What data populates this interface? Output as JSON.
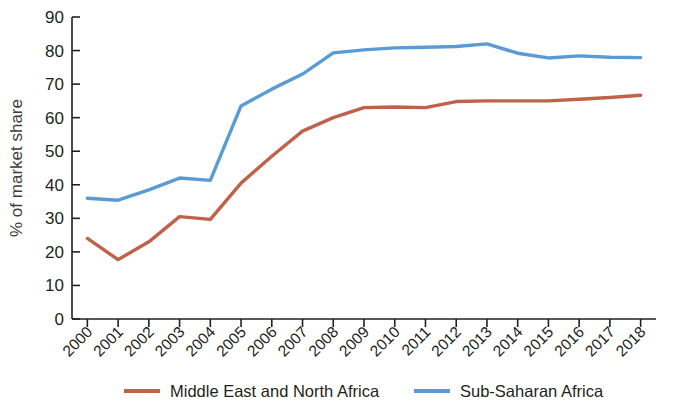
{
  "chart_data": {
    "type": "line",
    "title": "",
    "xlabel": "",
    "ylabel": "% of market share",
    "ylim": [
      0,
      90
    ],
    "ytick_step": 10,
    "yticks": [
      0,
      10,
      20,
      30,
      40,
      50,
      60,
      70,
      80,
      90
    ],
    "grid": false,
    "legend_position": "bottom",
    "x": [
      2000,
      2001,
      2002,
      2003,
      2004,
      2005,
      2006,
      2007,
      2008,
      2009,
      2010,
      2011,
      2012,
      2013,
      2014,
      2015,
      2016,
      2017,
      2018
    ],
    "categories": [
      "2000",
      "2001",
      "2002",
      "2003",
      "2004",
      "2005",
      "2006",
      "2007",
      "2008",
      "2009",
      "2010",
      "2011",
      "2012",
      "2013",
      "2014",
      "2015",
      "2016",
      "2017",
      "2018"
    ],
    "series": [
      {
        "name": "Middle East and North Africa",
        "color": "#c0614a",
        "values": [
          24.0,
          17.7,
          23.0,
          30.5,
          29.7,
          40.5,
          48.5,
          56.0,
          60.0,
          63.0,
          63.2,
          63.0,
          64.8,
          65.0,
          65.0,
          65.0,
          65.5,
          66.0,
          66.7
        ]
      },
      {
        "name": "Sub-Saharan Africa",
        "color": "#5b9bd5",
        "values": [
          36.0,
          35.4,
          38.5,
          42.0,
          41.3,
          63.5,
          68.5,
          73.0,
          79.3,
          80.2,
          80.8,
          81.0,
          81.2,
          82.0,
          79.2,
          77.8,
          78.4,
          78.0,
          77.9
        ]
      }
    ]
  },
  "axis": {
    "y_title": "% of market share"
  },
  "legend": {
    "items": [
      {
        "label": "Middle East and North Africa",
        "color": "#c0614a"
      },
      {
        "label": "Sub-Saharan Africa",
        "color": "#5b9bd5"
      }
    ]
  }
}
